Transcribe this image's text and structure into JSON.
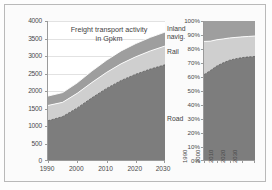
{
  "chart_data": [
    {
      "id": "absolute-chart",
      "type": "area",
      "stacked": true,
      "title": "Freight transport activity\nin Gpkm",
      "xlabel": "",
      "ylabel": "",
      "x": [
        1990,
        1995,
        2000,
        2005,
        2010,
        2015,
        2020,
        2025,
        2030
      ],
      "xlim": [
        1990,
        2030
      ],
      "ylim": [
        0,
        4000
      ],
      "yticks": [
        0,
        500,
        1000,
        1500,
        2000,
        2500,
        3000,
        3500,
        4000
      ],
      "ytick_labels": [
        "0",
        "500",
        "1000",
        "1500",
        "2000",
        "2500",
        "3000",
        "3500",
        "4000"
      ],
      "xticks": [
        1990,
        2000,
        2010,
        2020,
        2030
      ],
      "xtick_labels": [
        "1990",
        "2000",
        "2010",
        "2020",
        "2030"
      ],
      "grid": true,
      "legend_position": "inline-right",
      "series": [
        {
          "name": "Road",
          "color": "#7d7d7d",
          "values": [
            1130,
            1250,
            1500,
            1790,
            2060,
            2290,
            2470,
            2620,
            2740
          ]
        },
        {
          "name": "Rail",
          "color": "#cfcfcf",
          "values": [
            440,
            410,
            420,
            440,
            460,
            480,
            500,
            520,
            540
          ]
        },
        {
          "name": "Inland navig.",
          "color": "#9e9e9e",
          "values": [
            270,
            280,
            300,
            330,
            350,
            370,
            380,
            390,
            400
          ]
        }
      ],
      "totals": [
        1840,
        1940,
        2220,
        2560,
        2870,
        3140,
        3350,
        3530,
        3680
      ]
    },
    {
      "id": "percentage-chart",
      "type": "area",
      "stacked": true,
      "normalized": true,
      "title": "",
      "xlabel": "",
      "ylabel": "",
      "x": [
        1990,
        1995,
        2000,
        2005,
        2010,
        2015,
        2020,
        2025,
        2030
      ],
      "xlim": [
        1990,
        2030
      ],
      "ylim": [
        0,
        100
      ],
      "yticks": [
        0,
        10,
        20,
        30,
        40,
        50,
        60,
        70,
        80,
        90,
        100
      ],
      "ytick_labels": [
        "0%",
        "10%",
        "20%",
        "30%",
        "40%",
        "50%",
        "60%",
        "70%",
        "80%",
        "90%",
        "100%"
      ],
      "xticks": [
        1990,
        2000,
        2010,
        2020,
        2030
      ],
      "xtick_labels": [
        "1990",
        "2000",
        "2010",
        "2020",
        "2030"
      ],
      "grid": true,
      "legend_position": "none",
      "series": [
        {
          "name": "Road",
          "color": "#7d7d7d",
          "values": [
            61.4,
            64.4,
            67.6,
            69.9,
            71.8,
            72.9,
            73.7,
            74.2,
            74.5
          ]
        },
        {
          "name": "Rail",
          "color": "#cfcfcf",
          "values": [
            23.9,
            21.1,
            18.9,
            17.2,
            16.0,
            15.3,
            14.9,
            14.7,
            14.7
          ]
        },
        {
          "name": "Inland navig.",
          "color": "#9e9e9e",
          "values": [
            14.7,
            14.5,
            13.5,
            12.9,
            12.2,
            11.8,
            11.4,
            11.1,
            10.8
          ]
        }
      ]
    }
  ],
  "left_chart": {
    "title": "Freight transport activity\nin Gpkm",
    "y_labels": [
      "4000",
      "3500",
      "3000",
      "2500",
      "2000",
      "1500",
      "1000",
      "500",
      "0"
    ],
    "x_labels": [
      "1990",
      "2000",
      "2010",
      "2020",
      "2030"
    ],
    "series_labels": {
      "inland": "Inland\nnavig.",
      "rail": "Rail",
      "road": "Road"
    }
  },
  "right_chart": {
    "y_labels": [
      "100%",
      "90%",
      "80%",
      "70%",
      "60%",
      "50%",
      "40%",
      "30%",
      "20%",
      "10%",
      "0%"
    ],
    "x_labels": [
      "1990",
      "2000",
      "2010",
      "2020",
      "2030"
    ]
  },
  "colors": {
    "road": "#7d7d7d",
    "rail": "#cfcfcf",
    "inland": "#9e9e9e",
    "axis": "#9a9a9a",
    "grid": "#e2e2e2",
    "frame": "#b9b9b9",
    "text": "#4a4a4a"
  }
}
